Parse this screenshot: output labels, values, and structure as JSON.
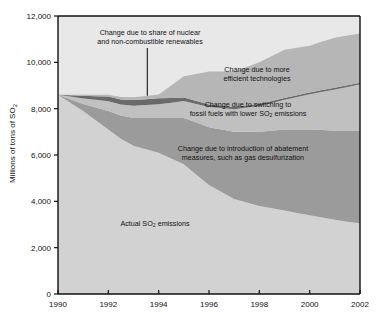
{
  "figure": {
    "ylabel": "Millions of tons of SO",
    "ylabel_sub": "2"
  },
  "annotations": {
    "nuclear_l1": "Change due to share of nuclear",
    "nuclear_l2": "and non-combustible renewables",
    "efficient_l1": "Change due to more",
    "efficient_l2": "efficient technologies",
    "switching_l1": "Change due to switching to",
    "switching_l2a": "fossil fuels with lower SO",
    "switching_sub": "2",
    "switching_l2b": " emissions",
    "abatement_l1": "Change due to introduction of abatement",
    "abatement_l2": "measures, such as gas desulfurization",
    "actual_a": "Actual SO",
    "actual_sub": "2",
    "actual_b": " emissions"
  },
  "colors": {
    "actual": "#d2d2d2",
    "abatement": "#9b9b9b",
    "switching": "#c0c0c0",
    "nuclear": "#6a6a6a",
    "efficient": "#b6b6b6",
    "axis": "#111111",
    "text": "#111111"
  },
  "chart_data": {
    "type": "area",
    "title": "",
    "xlabel": "",
    "ylabel": "Millions of tons of SO2",
    "xlim": [
      1990,
      2002
    ],
    "ylim": [
      0,
      12000
    ],
    "yticks": [
      "0",
      "2,000",
      "4,000",
      "6,000",
      "8,000",
      "10,000",
      "12,000"
    ],
    "ytick_values": [
      0,
      2000,
      4000,
      6000,
      8000,
      10000,
      12000
    ],
    "xticks": [
      "1990",
      "1992",
      "1994",
      "1996",
      "1998",
      "2000",
      "2002"
    ],
    "xtick_values": [
      1990,
      1992,
      1994,
      1996,
      1998,
      2000,
      2002
    ],
    "grid": false,
    "legend": "inline-annotations",
    "stacked": true,
    "x": [
      1990,
      1990.5,
      1991,
      1991.5,
      1992,
      1992.5,
      1993,
      1993.5,
      1994,
      1994.5,
      1995,
      1995.5,
      1996,
      1996.5,
      1997,
      1997.5,
      1998,
      1998.5,
      1999,
      1999.5,
      2000,
      2000.5,
      2001,
      2001.5,
      2002
    ],
    "series": [
      {
        "name": "Actual SO2 emissions",
        "color": "#d2d2d2",
        "values": [
          8600,
          8250,
          7900,
          7500,
          7100,
          6700,
          6400,
          6250,
          6100,
          5850,
          5600,
          5150,
          4700,
          4400,
          4100,
          3950,
          3800,
          3700,
          3600,
          3500,
          3400,
          3300,
          3200,
          3120,
          3050
        ]
      },
      {
        "name": "Change due to introduction of abatement measures, such as gas desulfurization",
        "color": "#9b9b9b",
        "values": [
          0,
          150,
          300,
          550,
          800,
          1000,
          1200,
          1350,
          1500,
          1750,
          2000,
          2250,
          2500,
          2700,
          2900,
          3050,
          3200,
          3350,
          3500,
          3600,
          3700,
          3780,
          3850,
          3920,
          4000
        ]
      },
      {
        "name": "Change due to switching to fossil fuels with lower SO2 emissions",
        "color": "#c0c0c0",
        "values": [
          0,
          120,
          240,
          330,
          420,
          480,
          530,
          560,
          590,
          660,
          730,
          800,
          870,
          930,
          980,
          1050,
          1120,
          1200,
          1280,
          1400,
          1520,
          1650,
          1780,
          1900,
          2000
        ]
      },
      {
        "name": "Change due to share of nuclear and non-combustible renewables",
        "color": "#6a6a6a",
        "values": [
          0,
          60,
          120,
          160,
          200,
          220,
          240,
          250,
          260,
          200,
          150,
          130,
          110,
          100,
          95,
          90,
          88,
          85,
          82,
          80,
          78,
          76,
          74,
          72,
          70
        ]
      },
      {
        "name": "Change due to more efficient technologies",
        "color": "#b6b6b6",
        "values": [
          0,
          20,
          40,
          60,
          80,
          100,
          120,
          140,
          160,
          540,
          920,
          1170,
          1420,
          1470,
          1520,
          1660,
          1800,
          1940,
          2080,
          2050,
          2020,
          2090,
          2160,
          2150,
          2130
        ]
      }
    ],
    "totals": [
      8600,
      8600,
      8600,
      8600,
      8600,
      8500,
      8490,
      8550,
      8610,
      9000,
      9400,
      9500,
      9600,
      9600,
      9595,
      9800,
      10008,
      10275,
      10542,
      10630,
      10718,
      10896,
      11064,
      11162,
      11250
    ]
  }
}
